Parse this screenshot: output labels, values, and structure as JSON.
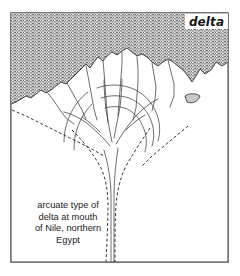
{
  "figure": {
    "name": "arcuate-delta-map",
    "background_color": "#ffffff",
    "frame_color": "#3a3a3a",
    "sea_pattern": "horizontal-dashed-hatch",
    "sea_pattern_color": "#4a4a4a",
    "land_color": "#ffffff",
    "lagoon_color": "#c9c9c9"
  },
  "map_label": {
    "text": "delta",
    "style": "bold-italic",
    "position": "top-right"
  },
  "caption": {
    "lines": [
      "arcuate type of",
      "delta at mouth",
      "of Nile, northern",
      "Egypt"
    ],
    "line1": "arcuate type of",
    "line2": "delta at mouth",
    "line3": "of Nile, northern",
    "line4": "Egypt",
    "alignment": "center"
  },
  "features": {
    "sea_label": "Mediterranean Sea",
    "land_label": "Nile Delta plain",
    "river_label": "Nile River valley",
    "lagoon_label": "coastal lagoon",
    "delta_type": "arcuate"
  }
}
